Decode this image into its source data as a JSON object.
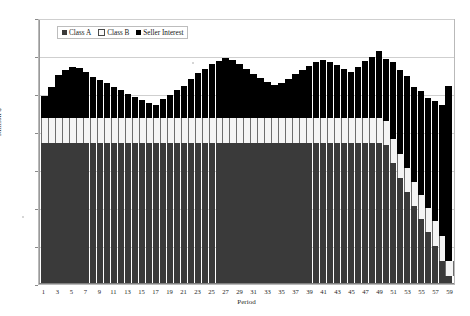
{
  "chart_data": {
    "type": "bar",
    "stacked": true,
    "title": "",
    "xlabel": "Period",
    "ylabel": "Million $",
    "ylim": [
      0,
      1400
    ],
    "ytick_values": [
      0,
      200,
      400,
      600,
      800,
      1000,
      1200,
      1400
    ],
    "ytick_labels": [
      "0",
      "200",
      "400",
      "600",
      "800",
      "1,000",
      "1,200",
      "1,400"
    ],
    "grid": true,
    "legend_position": "top-left-inside",
    "x": [
      1,
      2,
      3,
      4,
      5,
      6,
      7,
      8,
      9,
      10,
      11,
      12,
      13,
      14,
      15,
      16,
      17,
      18,
      19,
      20,
      21,
      22,
      23,
      24,
      25,
      26,
      27,
      28,
      29,
      30,
      31,
      32,
      33,
      34,
      35,
      36,
      37,
      38,
      39,
      40,
      41,
      42,
      43,
      44,
      45,
      46,
      47,
      48,
      49,
      50,
      51,
      52,
      53,
      54,
      55,
      56,
      57,
      58,
      59
    ],
    "xtick_labels": [
      "1",
      "",
      "3",
      "",
      "5",
      "",
      "7",
      "",
      "9",
      "",
      "11",
      "",
      "13",
      "",
      "15",
      "",
      "17",
      "",
      "19",
      "",
      "21",
      "",
      "23",
      "",
      "25",
      "",
      "27",
      "",
      "29",
      "",
      "31",
      "",
      "33",
      "",
      "35",
      "",
      "37",
      "",
      "39",
      "",
      "41",
      "",
      "43",
      "",
      "45",
      "",
      "47",
      "",
      "49",
      "",
      "51",
      "",
      "53",
      "",
      "55",
      "",
      "57",
      "",
      "59"
    ],
    "categories": [
      "1",
      "2",
      "3",
      "4",
      "5",
      "6",
      "7",
      "8",
      "9",
      "10",
      "11",
      "12",
      "13",
      "14",
      "15",
      "16",
      "17",
      "18",
      "19",
      "20",
      "21",
      "22",
      "23",
      "24",
      "25",
      "26",
      "27",
      "28",
      "29",
      "30",
      "31",
      "32",
      "33",
      "34",
      "35",
      "36",
      "37",
      "38",
      "39",
      "40",
      "41",
      "42",
      "43",
      "44",
      "45",
      "46",
      "47",
      "48",
      "49",
      "50",
      "51",
      "52",
      "53",
      "54",
      "55",
      "56",
      "57",
      "58",
      "59"
    ],
    "series": [
      {
        "name": "Class A",
        "color": "#3a3a3a",
        "values": [
          750,
          750,
          750,
          750,
          750,
          750,
          750,
          750,
          750,
          750,
          750,
          750,
          750,
          750,
          750,
          750,
          750,
          750,
          750,
          750,
          750,
          750,
          750,
          750,
          750,
          750,
          750,
          750,
          750,
          750,
          750,
          750,
          750,
          750,
          750,
          750,
          750,
          750,
          750,
          750,
          750,
          750,
          750,
          750,
          750,
          750,
          750,
          750,
          750,
          735,
          640,
          560,
          485,
          410,
          340,
          270,
          200,
          120,
          40
        ]
      },
      {
        "name": "Class B",
        "color": "#f4f4f4",
        "values": [
          130,
          130,
          130,
          130,
          130,
          130,
          130,
          130,
          130,
          130,
          130,
          130,
          130,
          130,
          130,
          130,
          130,
          130,
          130,
          130,
          130,
          130,
          130,
          130,
          130,
          130,
          130,
          130,
          130,
          130,
          130,
          130,
          130,
          130,
          130,
          130,
          130,
          130,
          130,
          130,
          130,
          130,
          130,
          130,
          130,
          130,
          130,
          130,
          130,
          130,
          130,
          130,
          130,
          130,
          130,
          130,
          130,
          130,
          75
        ]
      },
      {
        "name": "Seller Interest",
        "color": "#000000",
        "values": [
          120,
          170,
          230,
          260,
          275,
          270,
          250,
          220,
          205,
          190,
          165,
          150,
          130,
          115,
          100,
          80,
          70,
          105,
          125,
          150,
          175,
          210,
          240,
          265,
          290,
          305,
          320,
          310,
          290,
          265,
          235,
          215,
          195,
          180,
          190,
          210,
          235,
          260,
          280,
          300,
          310,
          300,
          285,
          265,
          245,
          275,
          305,
          330,
          360,
          330,
          410,
          450,
          490,
          510,
          555,
          590,
          640,
          700,
          940
        ]
      }
    ],
    "totals": [
      1000,
      1050,
      1110,
      1140,
      1155,
      1150,
      1130,
      1100,
      1085,
      1070,
      1045,
      1030,
      1010,
      995,
      980,
      960,
      950,
      985,
      1005,
      1030,
      1055,
      1090,
      1120,
      1145,
      1170,
      1185,
      1200,
      1190,
      1170,
      1145,
      1115,
      1095,
      1075,
      1060,
      1070,
      1090,
      1115,
      1140,
      1160,
      1180,
      1190,
      1180,
      1165,
      1145,
      1125,
      1155,
      1185,
      1210,
      1240,
      1195,
      1180,
      1140,
      1105,
      1050,
      1025,
      990,
      970,
      920,
      1055
    ]
  },
  "legend": {
    "items": [
      {
        "label": "Class A"
      },
      {
        "label": "Class B"
      },
      {
        "label": "Seller Interest"
      }
    ]
  }
}
